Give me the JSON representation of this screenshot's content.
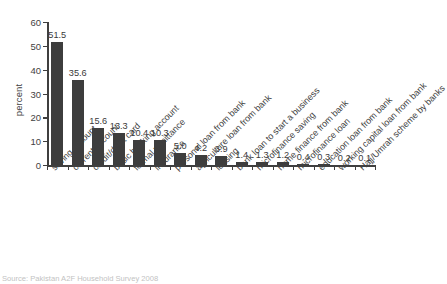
{
  "chart_data": {
    "type": "bar",
    "title": "",
    "subtitle": "",
    "xlabel": "",
    "ylabel": "percent",
    "ylim": [
      0,
      60
    ],
    "yticks": [
      0,
      10,
      20,
      30,
      40,
      50,
      60
    ],
    "grid": false,
    "legend": null,
    "bar_color": "#3d3d3d",
    "axis_color": "#3f3f3f",
    "categories": [
      "saving account",
      "current account",
      "credit/debit card",
      "basic banking account",
      "formal remittance",
      "insurance",
      "personal loan from bank",
      "agriculture loan from bank",
      "leasing",
      "bank loan to start a business",
      "microfinance saving",
      "home finance from bank",
      "microfinance loan",
      "education loan from bank",
      "working capital loan from bank",
      "Hajj/Umrah scheme by banks"
    ],
    "values": [
      51.5,
      35.6,
      15.6,
      13.3,
      10.4,
      10.3,
      5.0,
      4.2,
      3.9,
      1.4,
      1.3,
      1.2,
      0.4,
      0.3,
      0.2,
      0.1
    ],
    "value_labels": [
      "51.5",
      "35.6",
      "15.6",
      "13.3",
      "10.4",
      "10.3",
      "5.0",
      "4.2",
      "3.9",
      "1.4",
      "1.3",
      "1.2",
      "0.4",
      "0.3",
      "0.2",
      "0.1"
    ]
  },
  "axis": {
    "y_label": "percent",
    "y_tick_labels": [
      "0",
      "10",
      "20",
      "30",
      "40",
      "50",
      "60"
    ]
  },
  "source": {
    "note": "Source: Pakistan A2F Household Survey 2008"
  }
}
